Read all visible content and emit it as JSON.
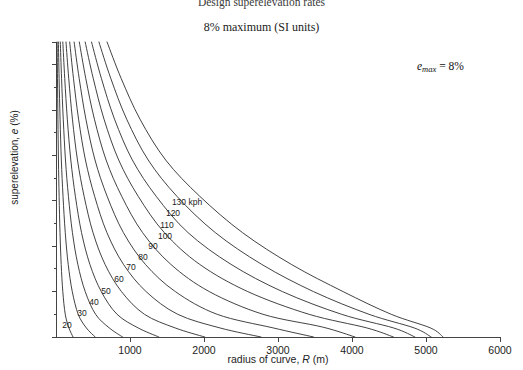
{
  "header": {
    "title": "Design superelevation rates",
    "subtitle": "8% maximum (SI units)"
  },
  "annotation": {
    "emax_text": "e",
    "emax_sub": "max",
    "emax_value": "= 8%"
  },
  "chart_data": {
    "type": "line",
    "title": "Design superelevation rates",
    "subtitle": "8% maximum (SI units)",
    "xlabel": "radius of curve, R (m)",
    "ylabel": "superelevation, e (%)",
    "xlim": [
      0,
      6000
    ],
    "ylim": [
      1.5,
      8.0
    ],
    "xticks": [
      1000,
      2000,
      3000,
      4000,
      5000,
      6000
    ],
    "xticklabels": [
      "1000",
      "2000",
      "3000",
      "4000",
      "5000",
      "6000"
    ],
    "yticks": [
      1.5,
      2.5,
      3.5,
      4.5,
      5.5,
      6.5,
      7.5,
      8.0
    ],
    "yticklabels": [
      "1.5",
      "2.5",
      "3.5",
      "4.5",
      "5.5",
      "6.5",
      "7.5",
      "8.0"
    ],
    "yminorticks": [
      2.0,
      3.0,
      4.0,
      5.0,
      6.0,
      7.0
    ],
    "grid": false,
    "legend": "inline-curve-labels",
    "annotations": [
      {
        "text": "emax = 8%",
        "x": 4900,
        "y": 7.35
      }
    ],
    "series": [
      {
        "name": "20",
        "label": "20 kph",
        "label_pos": {
          "x": 170,
          "y": 1.85
        },
        "points": [
          {
            "x": 15,
            "y": 8.0
          },
          {
            "x": 20,
            "y": 7.2
          },
          {
            "x": 26,
            "y": 6.3
          },
          {
            "x": 33,
            "y": 5.4
          },
          {
            "x": 42,
            "y": 4.6
          },
          {
            "x": 54,
            "y": 3.8
          },
          {
            "x": 70,
            "y": 3.1
          },
          {
            "x": 92,
            "y": 2.5
          },
          {
            "x": 125,
            "y": 2.0
          },
          {
            "x": 175,
            "y": 1.7
          },
          {
            "x": 230,
            "y": 1.5
          }
        ]
      },
      {
        "name": "30",
        "label": "30 kph",
        "label_pos": {
          "x": 360,
          "y": 2.2
        },
        "points": [
          {
            "x": 32,
            "y": 8.0
          },
          {
            "x": 42,
            "y": 7.2
          },
          {
            "x": 55,
            "y": 6.3
          },
          {
            "x": 72,
            "y": 5.4
          },
          {
            "x": 95,
            "y": 4.6
          },
          {
            "x": 125,
            "y": 3.8
          },
          {
            "x": 165,
            "y": 3.1
          },
          {
            "x": 220,
            "y": 2.5
          },
          {
            "x": 300,
            "y": 2.0
          },
          {
            "x": 410,
            "y": 1.7
          },
          {
            "x": 530,
            "y": 1.5
          }
        ]
      },
      {
        "name": "40",
        "label": "40 kph",
        "label_pos": {
          "x": 505,
          "y": 2.48
        },
        "points": [
          {
            "x": 58,
            "y": 8.0
          },
          {
            "x": 75,
            "y": 7.2
          },
          {
            "x": 98,
            "y": 6.3
          },
          {
            "x": 128,
            "y": 5.4
          },
          {
            "x": 168,
            "y": 4.6
          },
          {
            "x": 222,
            "y": 3.8
          },
          {
            "x": 295,
            "y": 3.1
          },
          {
            "x": 395,
            "y": 2.5
          },
          {
            "x": 535,
            "y": 2.0
          },
          {
            "x": 720,
            "y": 1.7
          },
          {
            "x": 900,
            "y": 1.5
          }
        ]
      },
      {
        "name": "50",
        "label": "50 kph",
        "label_pos": {
          "x": 665,
          "y": 2.78
        },
        "points": [
          {
            "x": 92,
            "y": 8.0
          },
          {
            "x": 118,
            "y": 7.2
          },
          {
            "x": 153,
            "y": 6.3
          },
          {
            "x": 200,
            "y": 5.4
          },
          {
            "x": 262,
            "y": 4.6
          },
          {
            "x": 345,
            "y": 3.8
          },
          {
            "x": 458,
            "y": 3.1
          },
          {
            "x": 612,
            "y": 2.5
          },
          {
            "x": 825,
            "y": 2.0
          },
          {
            "x": 1110,
            "y": 1.7
          },
          {
            "x": 1390,
            "y": 1.5
          }
        ]
      },
      {
        "name": "60",
        "label": "60 kph",
        "label_pos": {
          "x": 830,
          "y": 3.05
        },
        "points": [
          {
            "x": 135,
            "y": 8.0
          },
          {
            "x": 172,
            "y": 7.2
          },
          {
            "x": 222,
            "y": 6.3
          },
          {
            "x": 290,
            "y": 5.4
          },
          {
            "x": 380,
            "y": 4.6
          },
          {
            "x": 500,
            "y": 3.8
          },
          {
            "x": 663,
            "y": 3.1
          },
          {
            "x": 885,
            "y": 2.5
          },
          {
            "x": 1195,
            "y": 2.0
          },
          {
            "x": 1610,
            "y": 1.7
          },
          {
            "x": 2010,
            "y": 1.5
          }
        ]
      },
      {
        "name": "70",
        "label": "70 kph",
        "label_pos": {
          "x": 1000,
          "y": 3.32
        },
        "points": [
          {
            "x": 185,
            "y": 8.0
          },
          {
            "x": 236,
            "y": 7.2
          },
          {
            "x": 305,
            "y": 6.3
          },
          {
            "x": 398,
            "y": 5.4
          },
          {
            "x": 522,
            "y": 4.6
          },
          {
            "x": 688,
            "y": 3.8
          },
          {
            "x": 912,
            "y": 3.1
          },
          {
            "x": 1218,
            "y": 2.5
          },
          {
            "x": 1645,
            "y": 2.0
          },
          {
            "x": 2215,
            "y": 1.7
          },
          {
            "x": 2770,
            "y": 1.5
          }
        ]
      },
      {
        "name": "80",
        "label": "80 kph",
        "label_pos": {
          "x": 1180,
          "y": 3.62
        },
        "points": [
          {
            "x": 245,
            "y": 8.0
          },
          {
            "x": 313,
            "y": 7.2
          },
          {
            "x": 404,
            "y": 6.3
          },
          {
            "x": 527,
            "y": 5.4
          },
          {
            "x": 691,
            "y": 4.6
          },
          {
            "x": 911,
            "y": 3.8
          },
          {
            "x": 1208,
            "y": 3.1
          },
          {
            "x": 1613,
            "y": 2.5
          },
          {
            "x": 2178,
            "y": 2.0
          },
          {
            "x": 2935,
            "y": 1.7
          },
          {
            "x": 3480,
            "y": 1.5
          }
        ]
      },
      {
        "name": "90",
        "label": "90 kph",
        "label_pos": {
          "x": 1320,
          "y": 3.94
        },
        "points": [
          {
            "x": 315,
            "y": 8.0
          },
          {
            "x": 402,
            "y": 7.2
          },
          {
            "x": 519,
            "y": 6.3
          },
          {
            "x": 677,
            "y": 5.4
          },
          {
            "x": 888,
            "y": 4.6
          },
          {
            "x": 1170,
            "y": 3.8
          },
          {
            "x": 1552,
            "y": 3.1
          },
          {
            "x": 2072,
            "y": 2.5
          },
          {
            "x": 2798,
            "y": 2.0
          },
          {
            "x": 3600,
            "y": 1.72
          },
          {
            "x": 4040,
            "y": 1.5
          }
        ]
      },
      {
        "name": "100",
        "label": "100 kph",
        "label_pos": {
          "x": 1470,
          "y": 4.22
        },
        "points": [
          {
            "x": 394,
            "y": 8.0
          },
          {
            "x": 503,
            "y": 7.2
          },
          {
            "x": 649,
            "y": 6.3
          },
          {
            "x": 847,
            "y": 5.4
          },
          {
            "x": 1111,
            "y": 4.6
          },
          {
            "x": 1464,
            "y": 3.8
          },
          {
            "x": 1942,
            "y": 3.1
          },
          {
            "x": 2592,
            "y": 2.5
          },
          {
            "x": 3420,
            "y": 2.0
          },
          {
            "x": 4200,
            "y": 1.7
          },
          {
            "x": 4560,
            "y": 1.5
          }
        ]
      },
      {
        "name": "110",
        "label": "110 kph",
        "label_pos": {
          "x": 1620,
          "y": 4.53
        },
        "points": [
          {
            "x": 480,
            "y": 8.0
          },
          {
            "x": 613,
            "y": 7.2
          },
          {
            "x": 791,
            "y": 6.3
          },
          {
            "x": 1032,
            "y": 5.4
          },
          {
            "x": 1354,
            "y": 4.6
          },
          {
            "x": 1784,
            "y": 3.8
          },
          {
            "x": 2366,
            "y": 3.1
          },
          {
            "x": 3060,
            "y": 2.5
          },
          {
            "x": 3860,
            "y": 2.0
          },
          {
            "x": 4560,
            "y": 1.7
          },
          {
            "x": 4850,
            "y": 1.5
          }
        ]
      },
      {
        "name": "120",
        "label": "120 kph",
        "label_pos": {
          "x": 1715,
          "y": 4.85
        },
        "points": [
          {
            "x": 580,
            "y": 8.0
          },
          {
            "x": 740,
            "y": 7.2
          },
          {
            "x": 955,
            "y": 6.3
          },
          {
            "x": 1246,
            "y": 5.4
          },
          {
            "x": 1634,
            "y": 4.6
          },
          {
            "x": 2153,
            "y": 3.8
          },
          {
            "x": 2780,
            "y": 3.1
          },
          {
            "x": 3480,
            "y": 2.5
          },
          {
            "x": 4230,
            "y": 2.0
          },
          {
            "x": 4840,
            "y": 1.7
          },
          {
            "x": 5070,
            "y": 1.5
          }
        ]
      },
      {
        "name": "130",
        "label": "130 kph",
        "label_pos": {
          "x": 1830,
          "y": 5.17
        },
        "points": [
          {
            "x": 690,
            "y": 8.0
          },
          {
            "x": 880,
            "y": 7.2
          },
          {
            "x": 1135,
            "y": 6.3
          },
          {
            "x": 1482,
            "y": 5.4
          },
          {
            "x": 1943,
            "y": 4.6
          },
          {
            "x": 2520,
            "y": 3.8
          },
          {
            "x": 3180,
            "y": 3.1
          },
          {
            "x": 3880,
            "y": 2.5
          },
          {
            "x": 4530,
            "y": 2.0
          },
          {
            "x": 5060,
            "y": 1.7
          },
          {
            "x": 5230,
            "y": 1.5
          }
        ]
      }
    ],
    "curve_labels": [
      {
        "text": "20",
        "px": 67,
        "py": 325
      },
      {
        "text": "30",
        "px": 82,
        "py": 313
      },
      {
        "text": "40",
        "px": 94,
        "py": 302
      },
      {
        "text": "50",
        "px": 106,
        "py": 291
      },
      {
        "text": "60",
        "px": 119,
        "py": 279
      },
      {
        "text": "70",
        "px": 131,
        "py": 267
      },
      {
        "text": "80",
        "px": 143,
        "py": 257
      },
      {
        "text": "90",
        "px": 153,
        "py": 246
      },
      {
        "text": "100",
        "px": 165,
        "py": 236
      },
      {
        "text": "110",
        "px": 167,
        "py": 225
      },
      {
        "text": "120",
        "px": 173,
        "py": 213
      },
      {
        "text": "130 kph",
        "px": 187,
        "py": 202
      }
    ]
  }
}
